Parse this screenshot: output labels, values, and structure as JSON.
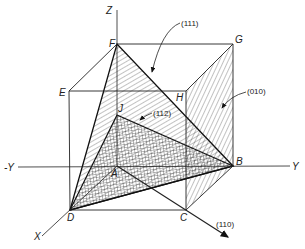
{
  "diagram": {
    "axes": {
      "z": "Z",
      "y_pos": "Y",
      "y_neg": "-Y",
      "x": "X"
    },
    "vertices": {
      "A": "A",
      "B": "B",
      "C": "C",
      "D": "D",
      "E": "E",
      "F": "F",
      "G": "G",
      "H": "H",
      "J": "J"
    },
    "planes": [
      {
        "label": "(111)",
        "vertices": [
          "D",
          "F",
          "B"
        ],
        "hatch": "diagonal"
      },
      {
        "label": "(010)",
        "vertices": [
          "C",
          "B",
          "G",
          "H"
        ],
        "hatch": "steep-diagonal"
      },
      {
        "label": "(112)",
        "vertices": [
          "D",
          "J",
          "B"
        ],
        "hatch": "crosshatch"
      }
    ],
    "direction": {
      "label": "(110)"
    }
  }
}
